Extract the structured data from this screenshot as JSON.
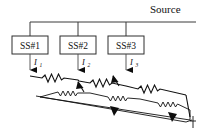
{
  "figure": {
    "title_label": "Source",
    "width": 205,
    "height": 137,
    "background_color": "#ffffff",
    "line_color": "#111111"
  },
  "source_bus": {
    "label": "Source",
    "y": 22,
    "x_start": 30,
    "x_end": 196
  },
  "substations": [
    {
      "id": "ss1",
      "label": "SS#1",
      "box": {
        "x": 12,
        "y": 36,
        "w": 36,
        "h": 18
      },
      "feeder_x": 30,
      "current": {
        "symbol": "I",
        "subscript": "1",
        "label": "I1"
      }
    },
    {
      "id": "ss2",
      "label": "SS#2",
      "box": {
        "x": 60,
        "y": 36,
        "w": 36,
        "h": 18
      },
      "feeder_x": 78,
      "current": {
        "symbol": "I",
        "subscript": "2",
        "label": "I2"
      }
    },
    {
      "id": "ss3",
      "label": "SS#3",
      "box": {
        "x": 108,
        "y": 36,
        "w": 36,
        "h": 18
      },
      "feeder_x": 126,
      "current": {
        "symbol": "I",
        "subscript": "3",
        "label": "I3"
      }
    }
  ],
  "rails": {
    "upper_rail_name": "running-rail-upper",
    "lower_rail_name": "running-rail-lower",
    "resistor_count_upper": 4,
    "resistor_count_lower": 4,
    "return_arrow_count": 3
  },
  "colors": {
    "ink": "#111111",
    "wire": "#3b3b3b",
    "paper": "#ffffff"
  }
}
